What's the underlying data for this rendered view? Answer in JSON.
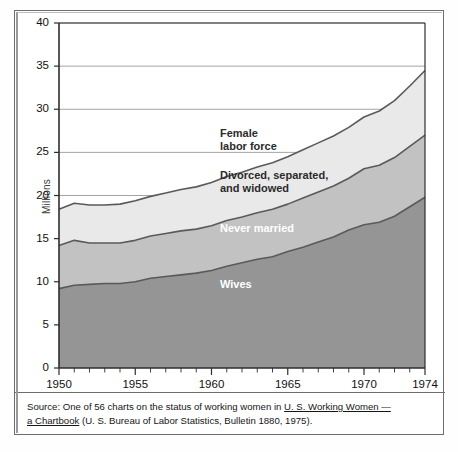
{
  "figure": {
    "source_prefix": "Source:",
    "source_line1_a": "One of 56 charts on the status of working women in",
    "source_line1_italic": "U. S. Working Women —",
    "source_line2_italic": "a Chartbook",
    "source_line2_b": "(U. S. Bureau of Labor Statistics, Bulletin 1880, 1975)."
  },
  "colors": {
    "wives": "#959595",
    "never_married": "#c2c2c2",
    "divorced_separated_widowed": "#e9e9e9",
    "female_labor_force": "#ffffff",
    "line": "#5a5a5a",
    "grid": "#8d8d8d",
    "axis": "#2e2e2e",
    "frame": "#6d6d6d"
  },
  "chart_data": {
    "type": "area",
    "stacked": true,
    "title": "",
    "xlabel": "",
    "ylabel": "Millions",
    "xlim": [
      1950,
      1974
    ],
    "ylim": [
      0,
      40
    ],
    "ytick_step": 5,
    "xtick_step": 1,
    "grid": true,
    "legend": "inline-labels",
    "x": [
      1950,
      1951,
      1952,
      1953,
      1954,
      1955,
      1956,
      1957,
      1958,
      1959,
      1960,
      1961,
      1962,
      1963,
      1964,
      1965,
      1966,
      1967,
      1968,
      1969,
      1970,
      1971,
      1972,
      1973,
      1974
    ],
    "xtick_labels": [
      "1950",
      "1955",
      "1960",
      "1965",
      "1970",
      "1974"
    ],
    "ytick_labels": [
      "0",
      "5",
      "10",
      "15",
      "20",
      "25",
      "30",
      "35",
      "40"
    ],
    "series": [
      {
        "name": "Wives",
        "label": "Wives",
        "color": "#959595",
        "values": [
          9.2,
          9.6,
          9.7,
          9.8,
          9.8,
          10.0,
          10.4,
          10.6,
          10.8,
          11.0,
          11.3,
          11.8,
          12.2,
          12.6,
          12.9,
          13.5,
          14.0,
          14.6,
          15.2,
          16.0,
          16.6,
          16.9,
          17.6,
          18.7,
          19.8
        ]
      },
      {
        "name": "Never married",
        "label": "Never married",
        "color": "#c2c2c2",
        "values": [
          5.0,
          5.2,
          4.8,
          4.7,
          4.7,
          4.8,
          4.9,
          5.0,
          5.1,
          5.1,
          5.2,
          5.3,
          5.3,
          5.4,
          5.5,
          5.5,
          5.7,
          5.8,
          5.9,
          6.0,
          6.5,
          6.6,
          6.8,
          7.0,
          7.2
        ]
      },
      {
        "name": "Divorced, separated, and widowed",
        "label_line1": "Divorced, separated,",
        "label_line2": "and widowed",
        "color": "#e9e9e9",
        "values": [
          4.2,
          4.3,
          4.4,
          4.4,
          4.5,
          4.6,
          4.6,
          4.7,
          4.8,
          4.9,
          5.0,
          5.1,
          5.2,
          5.3,
          5.4,
          5.5,
          5.6,
          5.7,
          5.8,
          5.9,
          6.0,
          6.3,
          6.6,
          7.0,
          7.5
        ]
      }
    ],
    "total_series": {
      "name": "Female labor force",
      "label_line1": "Female",
      "label_line2": "labor force",
      "values": [
        18.4,
        19.1,
        18.9,
        18.9,
        19.0,
        19.4,
        19.9,
        20.3,
        20.7,
        21.0,
        21.5,
        22.2,
        22.7,
        23.3,
        23.8,
        24.5,
        25.3,
        26.1,
        26.9,
        27.9,
        29.1,
        29.8,
        31.0,
        32.7,
        34.5
      ]
    },
    "band_boundaries": {
      "wives_top": [
        9.2,
        9.6,
        9.7,
        9.8,
        9.8,
        10.0,
        10.4,
        10.6,
        10.8,
        11.0,
        11.3,
        11.8,
        12.2,
        12.6,
        12.9,
        13.5,
        14.0,
        14.6,
        15.2,
        16.0,
        16.6,
        16.9,
        17.6,
        18.7,
        19.8
      ],
      "never_married_top": [
        14.2,
        14.8,
        14.5,
        14.5,
        14.5,
        14.8,
        15.3,
        15.6,
        15.9,
        16.1,
        16.5,
        17.1,
        17.5,
        18.0,
        18.4,
        19.0,
        19.7,
        20.4,
        21.1,
        22.0,
        23.1,
        23.5,
        24.4,
        25.7,
        27.0
      ],
      "total_top": [
        18.4,
        19.1,
        18.9,
        18.9,
        19.0,
        19.4,
        19.9,
        20.3,
        20.7,
        21.0,
        21.5,
        22.2,
        22.7,
        23.3,
        23.8,
        24.5,
        25.3,
        26.1,
        26.9,
        27.9,
        29.1,
        29.8,
        31.0,
        32.7,
        34.5
      ]
    }
  }
}
